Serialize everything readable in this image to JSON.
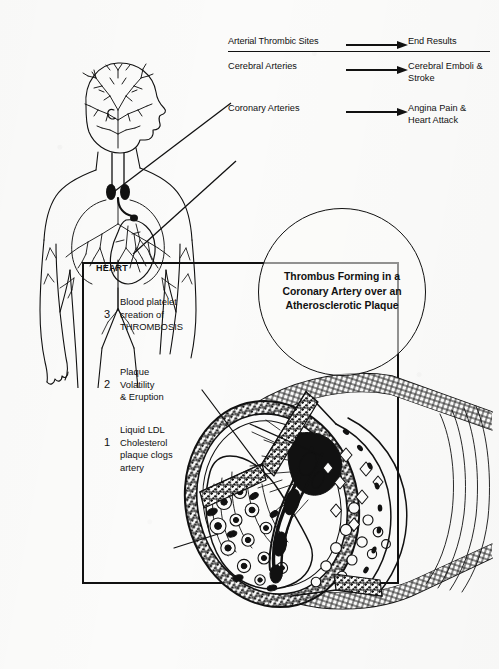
{
  "header": {
    "title_row": {
      "left": "Arterial Thrombic Sites",
      "right": "End Results",
      "arrow": "right-arrow-icon"
    },
    "rows": [
      {
        "site": "Cerebral\nArteries",
        "arrow": "right-arrow-icon",
        "result": "Cerebral\nEmboli &\nStroke"
      },
      {
        "site": "Coronary\nArteries",
        "arrow": "right-arrow-icon",
        "result": "Angina Pain\n& Heart\nAttack"
      }
    ]
  },
  "anatomy": {
    "figure_name": "human-body-vascular-figure",
    "heart_label": "HEART"
  },
  "callout": {
    "text": "Thrombus\nForming in a\nCoronary Artery\nover an\nAtherosclerotic\nPlaque"
  },
  "legend": [
    {
      "number": "3",
      "text": "Blood platelet\ncreation of\nTHROMBOSIS"
    },
    {
      "number": "2",
      "text": "Plaque\nVolatility\n& Eruption"
    },
    {
      "number": "1",
      "text": "Liquid LDL\nCholesterol\nplaque clogs\nartery"
    }
  ],
  "artery": {
    "figure_name": "coronary-artery-cutaway-cross-section"
  },
  "colors": {
    "ink": "#111111",
    "paper": "#fbfbfa"
  }
}
